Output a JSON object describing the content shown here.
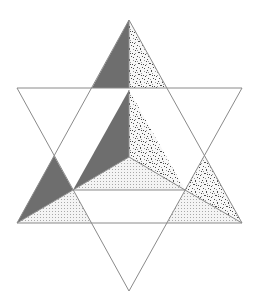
{
  "diagram": {
    "width": 257,
    "height": 307,
    "colors": {
      "background": "#ffffff",
      "stroke": "#8a8a8a",
      "dark_face": "#6e6e6e",
      "dotted_face_bg": "#f4f4f4",
      "dotted_face_dot": "#a8a8a8",
      "speckled_face_bg": "#f7f7f7",
      "speckled_face_dot": "#4a4a4a"
    },
    "outline": {
      "upward_triangle": [
        [
          129,
          20
        ],
        [
          17,
          223
        ],
        [
          242,
          223
        ]
      ],
      "downward_triangle": [
        [
          17,
          88
        ],
        [
          242,
          88
        ],
        [
          129,
          291
        ]
      ]
    },
    "faces": [
      {
        "name": "top-tip-left-face",
        "fill": "dark",
        "points": [
          [
            129,
            20
          ],
          [
            92,
            88
          ],
          [
            129,
            88
          ]
        ]
      },
      {
        "name": "top-tip-right-face",
        "fill": "speckled",
        "points": [
          [
            129,
            20
          ],
          [
            129,
            88
          ],
          [
            166,
            88
          ]
        ]
      },
      {
        "name": "inner-left-face",
        "fill": "dark",
        "points": [
          [
            129,
            90
          ],
          [
            73,
            190
          ],
          [
            129,
            157
          ]
        ]
      },
      {
        "name": "inner-right-face",
        "fill": "speckled",
        "points": [
          [
            129,
            90
          ],
          [
            129,
            157
          ],
          [
            185,
            190
          ]
        ]
      },
      {
        "name": "inner-bottom-face",
        "fill": "dotted",
        "points": [
          [
            129,
            157
          ],
          [
            73,
            190
          ],
          [
            185,
            190
          ]
        ]
      },
      {
        "name": "left-tip-upper-face",
        "fill": "dark",
        "points": [
          [
            54,
            156
          ],
          [
            17,
            223
          ],
          [
            73,
            190
          ]
        ]
      },
      {
        "name": "left-tip-lower-face",
        "fill": "dotted",
        "points": [
          [
            17,
            223
          ],
          [
            73,
            190
          ],
          [
            92,
            223
          ]
        ]
      },
      {
        "name": "right-tip-upper-face",
        "fill": "speckled",
        "points": [
          [
            204,
            156
          ],
          [
            185,
            190
          ],
          [
            242,
            223
          ]
        ]
      },
      {
        "name": "right-tip-lower-face",
        "fill": "dotted",
        "points": [
          [
            185,
            190
          ],
          [
            166,
            223
          ],
          [
            242,
            223
          ]
        ]
      }
    ],
    "inner_edges": [
      [
        [
          129,
          90
        ],
        [
          129,
          157
        ]
      ],
      [
        [
          129,
          157
        ],
        [
          73,
          190
        ]
      ],
      [
        [
          129,
          157
        ],
        [
          185,
          190
        ]
      ],
      [
        [
          73,
          190
        ],
        [
          185,
          190
        ]
      ],
      [
        [
          17,
          223
        ],
        [
          73,
          190
        ]
      ],
      [
        [
          185,
          190
        ],
        [
          242,
          223
        ]
      ],
      [
        [
          129,
          20
        ],
        [
          129,
          88
        ]
      ]
    ]
  }
}
